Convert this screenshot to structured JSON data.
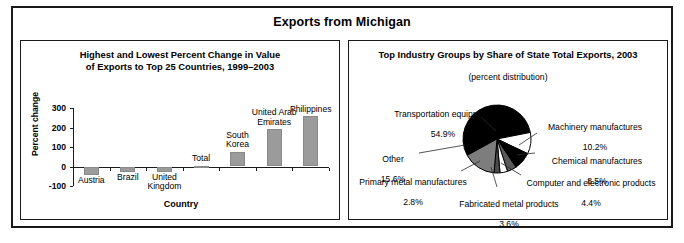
{
  "figure": {
    "title": "Exports from Michigan"
  },
  "chart_data": [
    {
      "type": "bar",
      "panel_name": "bar-chart-panel",
      "title": "Highest and Lowest Percent Change in Value\nof Exports to Top 25 Countries, 1999–2003",
      "title_line1": "Highest and Lowest Percent Change in Value",
      "title_line2": "of Exports to Top 25 Countries, 1999–2003",
      "xlabel": "Country",
      "ylabel": "Percent change",
      "ylim": [
        -100,
        300
      ],
      "yticks": [
        300,
        200,
        100,
        0,
        -100
      ],
      "ytick_labels": [
        "300",
        "200",
        "100",
        "0",
        "-100"
      ],
      "grid": false,
      "categories": [
        "Austria",
        "Brazil",
        "United Kingdom",
        "Total",
        "South Korea",
        "United Arab Emirates",
        "Philippines"
      ],
      "category_labels": [
        "Austria",
        "Brazil",
        "United\nKingdom",
        "Total",
        "South\nKorea",
        "United Arab\nEmirates",
        "Philippines"
      ],
      "values": [
        -45,
        -28,
        -26,
        4,
        74,
        190,
        258
      ]
    },
    {
      "type": "pie",
      "panel_name": "pie-chart-panel",
      "title": "Top Industry Groups by Share of State Total Exports, 2003",
      "subtitle": "(percent distribution)",
      "slices": [
        {
          "label": "Transportation equipment",
          "value": 54.9,
          "value_text": "54.9%",
          "color": "#000000"
        },
        {
          "label": "Machinery manufactures",
          "value": 10.2,
          "value_text": "10.2%",
          "color": "#ffffff"
        },
        {
          "label": "Chemical manufactures",
          "value": 8.5,
          "value_text": "8.5%",
          "color": "#000000"
        },
        {
          "label": "Computer and electronic products",
          "value": 4.4,
          "value_text": "4.4%",
          "color": "#5a5a5a"
        },
        {
          "label": "Fabricated metal products",
          "value": 3.6,
          "value_text": "3.6%",
          "color": "#ffffff"
        },
        {
          "label": "Primary metal manufactures",
          "value": 2.8,
          "value_text": "2.8%",
          "color": "#4a4a4a"
        },
        {
          "label": "Other",
          "value": 15.6,
          "value_text": "15.6%",
          "color": "#7d7d7d"
        }
      ],
      "labels": {
        "transportation": "Transportation equipment",
        "transportation_value": "54.9%",
        "machinery": "Machinery manufactures",
        "machinery_value": "10.2%",
        "chemical": "Chemical manufactures",
        "chemical_value": "8.5%",
        "computer": "Computer and electronic products",
        "computer_value": "4.4%",
        "fabricated": "Fabricated metal products",
        "fabricated_value": "3.6%",
        "primary": "Primary metal manufactures",
        "primary_value": "2.8%",
        "other": "Other",
        "other_value": "15.6%"
      }
    }
  ]
}
